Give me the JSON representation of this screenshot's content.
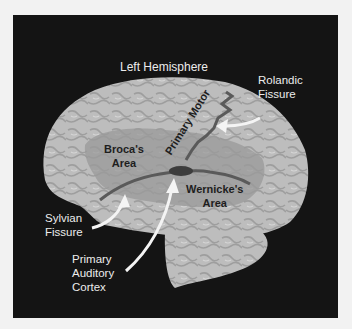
{
  "diagram": {
    "title": "Left Hemisphere",
    "labels": {
      "rolandic": [
        "Rolandic",
        "Fissure"
      ],
      "primary_motor": "Primary Motor",
      "broca": [
        "Broca's",
        "Area"
      ],
      "wernicke": [
        "Wernicke's",
        "Area"
      ],
      "sylvian": [
        "Sylvian",
        "Fissure"
      ],
      "auditory": [
        "Primary",
        "Auditory",
        "Cortex"
      ]
    },
    "colors": {
      "background": "#f2f2f2",
      "panel": "#141414",
      "brain": "#bdbdbd",
      "language_region": "#9a9a9a",
      "fissure": "#5a5a5a",
      "auditory_cortex": "#3c3c3c",
      "label_light": "#ececec",
      "label_dark": "#1e1e1e"
    }
  }
}
